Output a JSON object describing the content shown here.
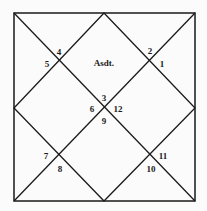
{
  "chart": {
    "type": "north-indian-horoscope",
    "ascendant_label": "Asdt.",
    "houses": [
      {
        "id": "h4",
        "label": "4",
        "x": 59,
        "y": 52
      },
      {
        "id": "h5",
        "label": "5",
        "x": 47,
        "y": 64
      },
      {
        "id": "h2",
        "label": "2",
        "x": 150,
        "y": 51
      },
      {
        "id": "h1",
        "label": "1",
        "x": 162,
        "y": 64
      },
      {
        "id": "h3",
        "label": "3",
        "x": 104,
        "y": 100
      },
      {
        "id": "h6",
        "label": "6",
        "x": 93,
        "y": 112
      },
      {
        "id": "h12",
        "label": "12",
        "x": 117,
        "y": 112
      },
      {
        "id": "h9",
        "label": "9",
        "x": 104,
        "y": 123
      },
      {
        "id": "h7",
        "label": "7",
        "x": 47,
        "y": 159
      },
      {
        "id": "h8",
        "label": "8",
        "x": 60,
        "y": 172
      },
      {
        "id": "h11",
        "label": "11",
        "x": 162,
        "y": 158
      },
      {
        "id": "h10",
        "label": "10",
        "x": 151,
        "y": 172
      }
    ],
    "line_color": "#1a1a1a"
  }
}
